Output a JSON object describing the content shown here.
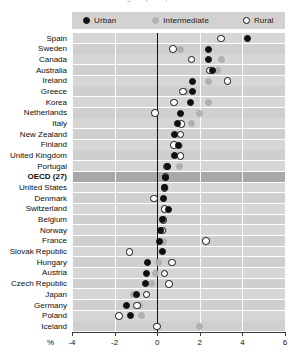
{
  "title": "Figure (cont.)",
  "legend": {
    "position": "top",
    "items": [
      {
        "key": "urban",
        "label": "Urban",
        "marker": "filled-circle-icon",
        "color": "#121212"
      },
      {
        "key": "intermediate",
        "label": "Intermediate",
        "marker": "gray-circle-icon",
        "color": "#b3b3b3"
      },
      {
        "key": "rural",
        "label": "Rural",
        "marker": "open-circle-icon",
        "color": "#ffffff"
      }
    ]
  },
  "axis": {
    "unit_label": "%",
    "ticks": [
      "-4",
      "-2",
      "0",
      "2",
      "4",
      "6"
    ],
    "min": -4,
    "max": 6
  },
  "highlight_row": "OECD (27)",
  "chart_data": {
    "type": "scatter",
    "title": "Figure (cont.)",
    "xlabel": "%",
    "ylabel": "",
    "xlim": [
      -4,
      6
    ],
    "grid": true,
    "legend_position": "top",
    "orientation": "horizontal",
    "categories": [
      "Spain",
      "Sweden",
      "Canada",
      "Australia",
      "Ireland",
      "Greece",
      "Korea",
      "Netherlands",
      "Italy",
      "New Zealand",
      "Finland",
      "United Kingdom",
      "Portugal",
      "OECD (27)",
      "United States",
      "Denmark",
      "Switzerland",
      "Belgium",
      "Norway",
      "France",
      "Slovak Republic",
      "Hungary",
      "Austria",
      "Czech Republic",
      "Japan",
      "Germany",
      "Poland",
      "Iceland"
    ],
    "series": [
      {
        "name": "Urban",
        "marker": "filled-circle",
        "color": "#121212",
        "values": [
          4.25,
          2.4,
          2.4,
          2.6,
          1.65,
          1.65,
          1.55,
          1.1,
          0.95,
          0.8,
          1.0,
          0.8,
          0.5,
          0.4,
          0.35,
          0.3,
          0.55,
          0.25,
          0.15,
          0.1,
          0.25,
          -0.45,
          -0.5,
          -0.55,
          -0.95,
          -1.45,
          -1.25,
          null
        ]
      },
      {
        "name": "Intermediate",
        "marker": "gray-circle",
        "color": "#b3b3b3",
        "values": [
          null,
          1.1,
          3.0,
          2.85,
          2.4,
          1.35,
          2.4,
          2.0,
          1.6,
          0.9,
          1.05,
          0.85,
          1.05,
          0.45,
          0.4,
          0.3,
          0.35,
          0.25,
          0.3,
          0.3,
          0.2,
          0.05,
          -0.1,
          -0.25,
          -1.1,
          -0.85,
          -0.75,
          2.0
        ]
      },
      {
        "name": "Rural",
        "marker": "open-circle",
        "color": "#ffffff",
        "values": [
          3.0,
          0.75,
          1.6,
          2.45,
          3.3,
          1.2,
          0.8,
          -0.1,
          1.15,
          1.1,
          0.8,
          1.1,
          0.45,
          0.4,
          0.35,
          -0.15,
          0.35,
          0.3,
          0.25,
          2.3,
          -1.3,
          0.7,
          0.35,
          0.55,
          -0.5,
          -0.95,
          -1.8,
          0.0
        ]
      }
    ]
  }
}
